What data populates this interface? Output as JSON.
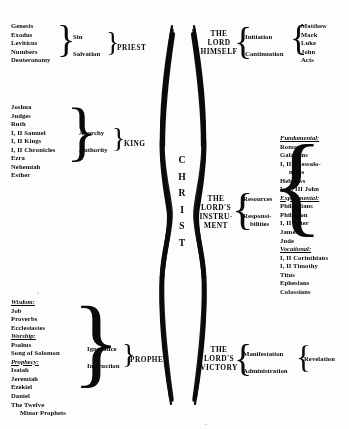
{
  "diagram": {
    "center_label_letters": [
      "C",
      "H",
      "R",
      "I",
      "S",
      "T"
    ],
    "ink_color": "#121212",
    "paper_color": "#fdfdfb"
  },
  "old_testament": {
    "groups": [
      {
        "id": "priest",
        "office": "PRIEST",
        "themes": [
          "Sin",
          "Salvation"
        ],
        "books": [
          {
            "text": "Genesis",
            "style": "plain"
          },
          {
            "text": "Exodus",
            "style": "plain"
          },
          {
            "text": "Leviticus",
            "style": "plain"
          },
          {
            "text": "Numbers",
            "style": "plain"
          },
          {
            "text": "Deuteronomy",
            "style": "plain"
          }
        ]
      },
      {
        "id": "king",
        "office": "KING",
        "themes": [
          "Anarchy",
          "Authority"
        ],
        "books": [
          {
            "text": "Joshua",
            "style": "plain"
          },
          {
            "text": "Judges",
            "style": "plain"
          },
          {
            "text": "Ruth",
            "style": "plain"
          },
          {
            "text": "I, II Samuel",
            "style": "plain"
          },
          {
            "text": "I, II Kings",
            "style": "plain"
          },
          {
            "text": "I, II Chronicles",
            "style": "plain"
          },
          {
            "text": "Ezra",
            "style": "plain"
          },
          {
            "text": "Nehemiah",
            "style": "plain"
          },
          {
            "text": "Esther",
            "style": "plain"
          }
        ]
      },
      {
        "id": "prophet",
        "office": "PROPHET",
        "themes": [
          "Ignorance",
          "Instruction"
        ],
        "books": [
          {
            "text": "Wisdom:",
            "style": "heading"
          },
          {
            "text": "Job",
            "style": "plain"
          },
          {
            "text": "Proverbs",
            "style": "plain"
          },
          {
            "text": "Ecclesiastes",
            "style": "plain"
          },
          {
            "text": "Worship:",
            "style": "heading"
          },
          {
            "text": "Psalms",
            "style": "plain"
          },
          {
            "text": "Song of Solomon",
            "style": "plain"
          },
          {
            "text": "Prophecy:",
            "style": "heading"
          },
          {
            "text": "Isaiah",
            "style": "plain"
          },
          {
            "text": "Jeremiah",
            "style": "plain"
          },
          {
            "text": "Ezekiel",
            "style": "plain"
          },
          {
            "text": "Daniel",
            "style": "plain"
          },
          {
            "text": "The Twelve",
            "style": "plain"
          },
          {
            "text": "Minor Prophets",
            "style": "indent"
          }
        ]
      }
    ]
  },
  "new_testament": {
    "groups": [
      {
        "id": "lord-himself",
        "office_lines": [
          "THE",
          "LORD",
          "HIMSELF"
        ],
        "themes": [
          "Initiation",
          "Continuation"
        ],
        "books": [
          {
            "text": "Matthew",
            "style": "plain"
          },
          {
            "text": "Mark",
            "style": "plain"
          },
          {
            "text": "Luke",
            "style": "plain"
          },
          {
            "text": "John",
            "style": "plain"
          },
          {
            "text": "Acts",
            "style": "plain"
          }
        ]
      },
      {
        "id": "lords-instrument",
        "office_lines": [
          "THE",
          "LORD'S",
          "INSTRU-",
          "MENT"
        ],
        "themes": [
          "Resources",
          "Responsi-",
          "bilities"
        ],
        "books": [
          {
            "text": "Fundamental:",
            "style": "heading"
          },
          {
            "text": "Romans",
            "style": "plain"
          },
          {
            "text": "Galatians",
            "style": "plain"
          },
          {
            "text": "I, II Thessalo-",
            "style": "plain"
          },
          {
            "text": "nians",
            "style": "indent"
          },
          {
            "text": "Hebrews",
            "style": "plain"
          },
          {
            "text": "I, II, III John",
            "style": "plain"
          },
          {
            "text": "Experimental:",
            "style": "heading"
          },
          {
            "text": "Philippians",
            "style": "plain"
          },
          {
            "text": "Philemon",
            "style": "plain"
          },
          {
            "text": "I, II Peter",
            "style": "plain"
          },
          {
            "text": "James",
            "style": "plain"
          },
          {
            "text": "Jude",
            "style": "plain"
          },
          {
            "text": "Vocational:",
            "style": "heading"
          },
          {
            "text": "I, II Corinthians",
            "style": "plain"
          },
          {
            "text": "I, II Timothy",
            "style": "plain"
          },
          {
            "text": "Titus",
            "style": "plain"
          },
          {
            "text": "Ephesians",
            "style": "plain"
          },
          {
            "text": "Colossians",
            "style": "plain"
          }
        ]
      },
      {
        "id": "lords-victory",
        "office_lines": [
          "THE",
          "LORD'S",
          "VICTORY"
        ],
        "themes": [
          "Manifestation",
          "Administration"
        ],
        "books": [
          {
            "text": "Revelation",
            "style": "plain"
          }
        ]
      }
    ]
  }
}
